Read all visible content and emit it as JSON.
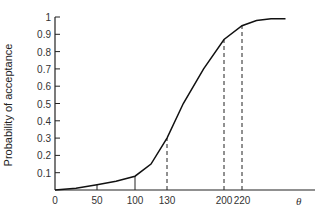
{
  "chart_data": {
    "type": "line",
    "title": "",
    "xlabel": "θ",
    "ylabel": "Probability of acceptance",
    "xticks": [
      0,
      50,
      100,
      130,
      200,
      220
    ],
    "yticks": [
      0.1,
      0.2,
      0.3,
      0.4,
      0.5,
      0.6,
      0.7,
      0.8,
      0.9,
      1
    ],
    "ylim": [
      0,
      1
    ],
    "xlim": [
      0,
      300
    ],
    "grid": false,
    "legend": null,
    "series": [
      {
        "name": "Operating characteristic curve",
        "x": [
          0,
          25,
          50,
          75,
          100,
          115,
          130,
          150,
          175,
          200,
          220,
          240,
          260,
          280
        ],
        "y": [
          0.0,
          0.01,
          0.03,
          0.05,
          0.08,
          0.15,
          0.3,
          0.5,
          0.7,
          0.87,
          0.95,
          0.98,
          0.99,
          0.99
        ]
      }
    ],
    "annotations": [
      {
        "x": 50,
        "y": 0.03,
        "style": "solid"
      },
      {
        "x": 100,
        "y": 0.08,
        "style": "solid"
      },
      {
        "x": 130,
        "y": 0.3,
        "style": "dashed"
      },
      {
        "x": 200,
        "y": 0.87,
        "style": "dashed"
      },
      {
        "x": 220,
        "y": 0.95,
        "style": "dashed"
      }
    ]
  },
  "labels": {
    "ylabel": "Probability of acceptance",
    "xlabel": "θ",
    "yticks": [
      "0.1",
      "0.2",
      "0.3",
      "0.4",
      "0.5",
      "0.6",
      "0.7",
      "0.8",
      "0.9",
      "1"
    ],
    "xticks": [
      "0",
      "50",
      "100",
      "130",
      "200",
      "220"
    ]
  }
}
